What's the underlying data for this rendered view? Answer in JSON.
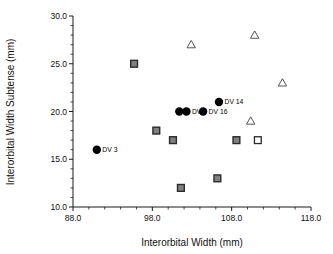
{
  "chart_data": {
    "type": "scatter",
    "title": "",
    "xlabel": "Interorbital Width (mm)",
    "ylabel": "Interorbital Width Subtense (mm)",
    "xlim": [
      88.0,
      118.0
    ],
    "ylim": [
      10.0,
      30.0
    ],
    "grid": false,
    "legend": "none",
    "x_ticks": [
      "88.0",
      "98.0",
      "108.0",
      "118.0"
    ],
    "x_tick_values": [
      88.0,
      98.0,
      108.0,
      118.0
    ],
    "x_minor_count": 4,
    "y_ticks": [
      "10.0",
      "15.0",
      "20.0",
      "25.0",
      "30.0"
    ],
    "y_tick_values": [
      10.0,
      15.0,
      20.0,
      25.0,
      30.0
    ],
    "y_minor_count": 4,
    "series": [
      {
        "name": "labeled-specimens",
        "marker": "filled-circle",
        "color": "#000000",
        "points": [
          {
            "x": 91.0,
            "y": 16.0,
            "label": "DV 3",
            "label_pos": "right"
          },
          {
            "x": 101.4,
            "y": 20.0,
            "label": "",
            "label_pos": "right"
          },
          {
            "x": 102.3,
            "y": 20.0,
            "label": "DV 5",
            "label_pos": "right"
          },
          {
            "x": 104.4,
            "y": 20.0,
            "label": "DV 16",
            "label_pos": "right"
          },
          {
            "x": 106.4,
            "y": 21.0,
            "label": "DV 14",
            "label_pos": "right"
          }
        ]
      },
      {
        "name": "gray-squares",
        "marker": "filled-square",
        "color": "#808080",
        "points": [
          {
            "x": 95.7,
            "y": 25.0
          },
          {
            "x": 98.5,
            "y": 18.0
          },
          {
            "x": 100.6,
            "y": 17.0
          },
          {
            "x": 101.6,
            "y": 12.0
          },
          {
            "x": 106.2,
            "y": 13.0
          },
          {
            "x": 108.6,
            "y": 17.0
          }
        ]
      },
      {
        "name": "open-squares",
        "marker": "open-square",
        "color": "#ffffff",
        "points": [
          {
            "x": 111.3,
            "y": 17.0
          }
        ]
      },
      {
        "name": "open-triangles",
        "marker": "open-triangle",
        "color": "#555555",
        "points": [
          {
            "x": 102.9,
            "y": 27.0
          },
          {
            "x": 110.9,
            "y": 28.0
          },
          {
            "x": 110.4,
            "y": 19.0
          },
          {
            "x": 114.4,
            "y": 23.0
          }
        ]
      }
    ]
  },
  "axes": {
    "x_title": "Interorbital Width (mm)",
    "y_title": "Interorbital Width Subtense (mm)"
  }
}
